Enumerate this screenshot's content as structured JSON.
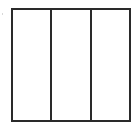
{
  "diagram": {
    "type": "rectangle divided into equal parts",
    "orientation": "vertical",
    "parts": 3,
    "shaded_parts": 0,
    "colors": {
      "stroke": "#2a2a2a",
      "fill": "#ffffff"
    },
    "columns": [
      {
        "index": 1,
        "shaded": false
      },
      {
        "index": 2,
        "shaded": false
      },
      {
        "index": 3,
        "shaded": false
      }
    ]
  }
}
